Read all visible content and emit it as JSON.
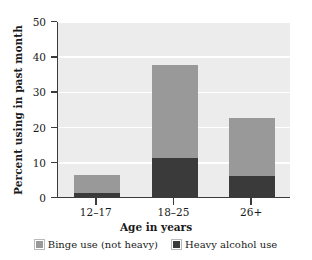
{
  "chart_data": {
    "type": "bar",
    "subtype": "stacked-bar",
    "title": "",
    "xlabel": "Age in years",
    "ylabel": "Percent using in past month",
    "categories": [
      "12–17",
      "18–25",
      "26+"
    ],
    "series": [
      {
        "name": "Heavy alcohol use",
        "values": [
          1.0,
          11.0,
          6.0
        ],
        "color": "#3a3a3a"
      },
      {
        "name": "Binge use (not heavy)",
        "values": [
          5.3,
          26.5,
          16.4
        ],
        "color": "#999999"
      }
    ],
    "totals": [
      6.3,
      37.5,
      22.4
    ],
    "ylim": [
      0,
      50
    ],
    "yticks": [
      0,
      10,
      20,
      30,
      40,
      50
    ],
    "ytick_labels": [
      "0",
      "10",
      "20",
      "30",
      "40",
      "50"
    ],
    "grid": "horizontal-white-on-gray",
    "legend_position": "bottom-center",
    "plot_background": "#ececec"
  },
  "legend": {
    "items": [
      {
        "label": "Binge use (not heavy)",
        "key": "binge"
      },
      {
        "label": "Heavy alcohol use",
        "key": "heavy"
      }
    ]
  }
}
